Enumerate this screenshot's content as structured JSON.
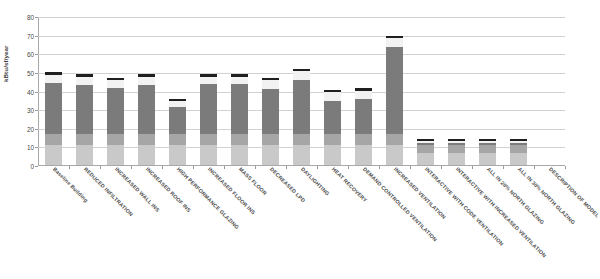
{
  "chart_data": {
    "type": "bar",
    "subtype": "stacked-bar",
    "title": "",
    "subtitle": "",
    "xlabel": "",
    "ylabel": "kBtu/sf/year",
    "ylim": [
      0,
      80
    ],
    "yticks": [
      0,
      10,
      20,
      30,
      40,
      50,
      60,
      70,
      80
    ],
    "grid": true,
    "legend": "none",
    "categories": [
      "Baseline Building",
      "REDUCED INFILTRATION",
      "INCREASED WALL INS",
      "INCREASED ROOF INS",
      "HIGH PERFORMANCE GLAZING",
      "INCREASED FLOOR INS",
      "MASS FLOOR",
      "DECREASED LPD",
      "DAYLIGHTING",
      "HEAT RECOVERY",
      "DEMAND CONTROLLED VENTILATION",
      "INCREASED VENTILATION",
      "INTERACTIVE WITH CODE VENTILATION",
      "INTERACTIVE WITH INCREASED VENTILATION",
      "ALL IN 20% NORTH GLAZING",
      "ALL IN 30% NORTH GLAZING",
      "DESCRIPTION OF MODEL"
    ],
    "series": [
      {
        "name": "segment-1-light-gray",
        "color": "#c9c9c9",
        "values": [
          11.0,
          11.0,
          11.0,
          11.0,
          11.0,
          11.0,
          11.0,
          11.0,
          11.0,
          11.0,
          11.0,
          11.0,
          6.5,
          6.5,
          6.5,
          6.5,
          null
        ]
      },
      {
        "name": "segment-2-medium-gray",
        "color": "#a6a6a6",
        "values": [
          5.5,
          5.5,
          5.5,
          5.5,
          5.5,
          5.5,
          5.5,
          5.5,
          5.5,
          5.5,
          5.5,
          5.5,
          4.5,
          4.5,
          4.5,
          4.5,
          null
        ]
      },
      {
        "name": "segment-3-dark-gray",
        "color": "#7b7b7b",
        "values": [
          27.5,
          26.5,
          25.0,
          26.5,
          14.5,
          27.0,
          27.0,
          24.5,
          29.0,
          18.0,
          19.0,
          47.0,
          1.0,
          1.0,
          1.0,
          1.0,
          null
        ]
      },
      {
        "name": "segment-4-white",
        "color": "#f2f2f2",
        "values": [
          4.5,
          4.5,
          4.0,
          4.5,
          3.5,
          4.0,
          4.0,
          4.5,
          5.0,
          4.5,
          4.5,
          4.5,
          0.8,
          0.8,
          0.8,
          0.8,
          null
        ]
      }
    ],
    "totals": [
      48.5,
      47.5,
      45.5,
      47.5,
      34.5,
      47.5,
      47.5,
      45.5,
      50.5,
      39.0,
      40.0,
      68.0,
      12.8,
      12.8,
      12.8,
      12.8,
      null
    ],
    "cap_marker": {
      "name": "total-marker",
      "color": "#1f1f1f",
      "height_units": 1.2
    }
  }
}
